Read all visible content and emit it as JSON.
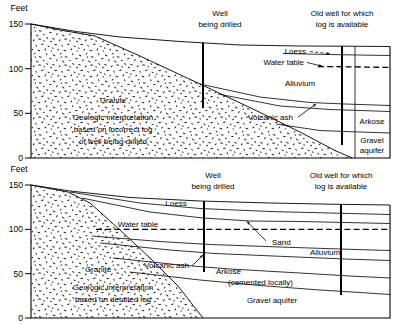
{
  "figure": {
    "axis_unit_label": "Feet",
    "axis_ticks": [
      "150",
      "100",
      "50",
      "0"
    ],
    "axis_values": [
      150,
      100,
      50,
      0
    ],
    "stroke_color": "#000000",
    "background_color": "#ffffff"
  },
  "panels": [
    {
      "id": "upper",
      "axis_label": "Feet",
      "ticks": [
        "150",
        "100",
        "50",
        "0"
      ],
      "wells": [
        {
          "name": "well-being-drilled",
          "label_line1": "Well",
          "label_line2": "being drilled"
        },
        {
          "name": "old-well",
          "label_line1": "Old well for which",
          "label_line2": "log is available"
        }
      ],
      "units": [
        {
          "name": "granite",
          "label": "Granite"
        },
        {
          "name": "loess",
          "label": "Loess"
        },
        {
          "name": "water-table",
          "label": "Water table"
        },
        {
          "name": "alluvium",
          "label": "Alluvium"
        },
        {
          "name": "volcanic-ash",
          "label": "Volcanic ash"
        },
        {
          "name": "arkose",
          "label": "Arkose"
        },
        {
          "name": "gravel-aquifer",
          "label_line1": "Gravel",
          "label_line2": "aquifer"
        }
      ],
      "caption": {
        "line1": "Geologic interpretation",
        "line2": "based on incorrect log",
        "line3": "of well being drilled"
      }
    },
    {
      "id": "lower",
      "axis_label": "Feet",
      "ticks": [
        "150",
        "100",
        "50",
        "0"
      ],
      "wells": [
        {
          "name": "well-being-drilled",
          "label_line1": "Well",
          "label_line2": "being drilled"
        },
        {
          "name": "old-well",
          "label_line1": "Old well for which",
          "label_line2": "log is available"
        }
      ],
      "units": [
        {
          "name": "granite",
          "label": "Granite"
        },
        {
          "name": "loess",
          "label": "Loess"
        },
        {
          "name": "water-table",
          "label": "Water table"
        },
        {
          "name": "sand",
          "label": "Sand"
        },
        {
          "name": "alluvium",
          "label": "Alluvium"
        },
        {
          "name": "volcanic-ash",
          "label": "Volcanic ash"
        },
        {
          "name": "arkose",
          "label": "Arkose"
        },
        {
          "name": "arkose-note",
          "label": "(cemented locally)"
        },
        {
          "name": "gravel-aquifer",
          "label": "Gravel aquifer"
        }
      ],
      "caption": {
        "line1": "Geologic interpretation",
        "line2": "based on detailed log"
      }
    }
  ]
}
